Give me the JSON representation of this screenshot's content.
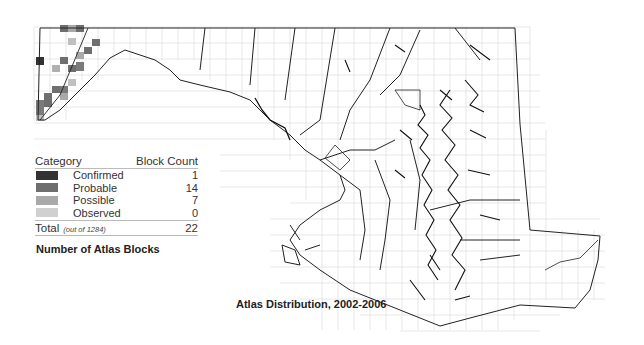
{
  "map": {
    "title": "Atlas Distribution, 2002-2006",
    "region": "Maryland",
    "grid_color": "#d9d9d9",
    "outline_color": "#222222"
  },
  "legend": {
    "title": "Number of Atlas Blocks",
    "header_category": "Category",
    "header_count": "Block Count",
    "items": [
      {
        "label": "Confirmed",
        "count": "1",
        "color": "#333333"
      },
      {
        "label": "Probable",
        "count": "14",
        "color": "#6e6e6e"
      },
      {
        "label": "Possible",
        "count": "7",
        "color": "#a9a9a9"
      },
      {
        "label": "Observed",
        "count": "0",
        "color": "#d0d0d0"
      }
    ],
    "total_label": "Total",
    "total_note": "(out of 1284)",
    "total_count": "22"
  }
}
